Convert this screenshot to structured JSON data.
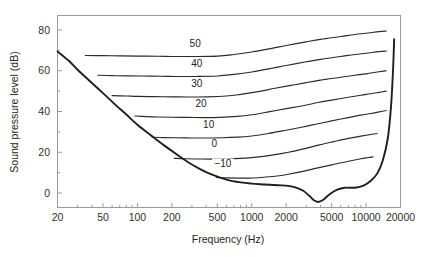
{
  "chart_data": {
    "type": "line",
    "title": "",
    "xlabel": "Frequency (Hz)",
    "ylabel": "Sound pressure level (dB)",
    "xscale": "log",
    "xlim": [
      20,
      20000
    ],
    "ylim": [
      -10,
      85
    ],
    "grid": false,
    "legend": "inline-labels",
    "xticks": [
      20,
      50,
      100,
      200,
      500,
      1000,
      2000,
      5000,
      10000,
      20000
    ],
    "xtick_labels": [
      "20",
      "50",
      "100",
      "200",
      "500",
      "1000",
      "2000",
      "5000",
      "10000",
      "20000"
    ],
    "yticks": [
      0,
      20,
      40,
      60,
      80
    ],
    "ytick_labels": [
      "0",
      "20",
      "40",
      "60",
      "80"
    ],
    "yticks_minor": [
      10,
      30,
      50,
      70
    ],
    "series": [
      {
        "name": "50",
        "label": "50",
        "label_freq": 320,
        "label_level": 71.5,
        "x": [
          35,
          50,
          70,
          100,
          150,
          200,
          300,
          500,
          700,
          1000,
          1500,
          2000,
          3000,
          4000,
          6000,
          8000,
          10000,
          13000,
          15000
        ],
        "values": [
          67.5,
          67.4,
          67.3,
          67.2,
          67.1,
          67.0,
          67.0,
          67.2,
          68.0,
          69.2,
          71.0,
          72.4,
          74.2,
          75.4,
          76.8,
          77.8,
          78.4,
          79.2,
          79.5
        ]
      },
      {
        "name": "40",
        "label": "40",
        "label_freq": 330,
        "label_level": 62.0,
        "x": [
          45,
          60,
          80,
          110,
          160,
          220,
          320,
          500,
          700,
          1000,
          1500,
          2000,
          3000,
          4000,
          6000,
          8000,
          10000,
          13000,
          15000
        ],
        "values": [
          57.8,
          57.6,
          57.5,
          57.4,
          57.3,
          57.2,
          57.2,
          57.4,
          58.2,
          59.4,
          61.2,
          62.6,
          64.4,
          65.6,
          67.0,
          68.0,
          68.6,
          69.4,
          69.7
        ]
      },
      {
        "name": "30",
        "label": "30",
        "label_freq": 330,
        "label_level": 52.0,
        "x": [
          60,
          80,
          100,
          140,
          200,
          280,
          400,
          600,
          800,
          1100,
          1600,
          2200,
          3000,
          4000,
          6000,
          8000,
          10000,
          13000,
          15000
        ],
        "values": [
          47.8,
          47.6,
          47.4,
          47.3,
          47.2,
          47.1,
          47.2,
          47.6,
          48.4,
          49.6,
          51.4,
          52.8,
          54.2,
          55.4,
          56.8,
          57.8,
          58.5,
          59.5,
          60.0
        ]
      },
      {
        "name": "20",
        "label": "20",
        "label_freq": 360,
        "label_level": 42.0,
        "x": [
          95,
          120,
          150,
          200,
          280,
          380,
          520,
          750,
          1000,
          1400,
          2000,
          2800,
          3800,
          5000,
          7000,
          9000,
          11000,
          13000,
          15000
        ],
        "values": [
          37.8,
          37.5,
          37.3,
          37.2,
          37.1,
          37.0,
          37.1,
          37.6,
          38.4,
          39.8,
          41.4,
          42.8,
          44.4,
          45.6,
          47.0,
          48.0,
          48.7,
          49.4,
          50.0
        ]
      },
      {
        "name": "10",
        "label": "10",
        "label_freq": 420,
        "label_level": 32.0,
        "x": [
          135,
          170,
          220,
          300,
          400,
          550,
          750,
          1000,
          1400,
          2000,
          2800,
          3800,
          5000,
          7000,
          9000,
          11000,
          13000,
          15000
        ],
        "values": [
          27.4,
          27.2,
          27.1,
          27.0,
          27.0,
          27.1,
          27.4,
          28.0,
          29.2,
          30.8,
          32.4,
          34.0,
          35.4,
          37.0,
          38.2,
          39.0,
          39.8,
          40.5
        ]
      },
      {
        "name": "0",
        "label": "0",
        "label_freq": 470,
        "label_level": 22.5,
        "x": [
          210,
          260,
          330,
          440,
          600,
          800,
          1100,
          1500,
          2100,
          2900,
          3900,
          5200,
          7000,
          9000,
          11000,
          12500
        ],
        "values": [
          17.0,
          16.8,
          16.7,
          16.6,
          16.7,
          17.0,
          17.6,
          18.6,
          20.0,
          21.8,
          23.6,
          25.2,
          26.8,
          27.9,
          28.7,
          29.2
        ]
      },
      {
        "name": "-10",
        "label": "−10",
        "label_freq": 560,
        "label_level": 13.0,
        "x": [
          490,
          600,
          750,
          950,
          1200,
          1600,
          2100,
          2800,
          3700,
          5000,
          7000,
          9000,
          10500,
          11500
        ],
        "values": [
          7.6,
          7.4,
          7.3,
          7.3,
          7.6,
          8.2,
          9.2,
          10.6,
          12.2,
          13.8,
          15.6,
          16.8,
          17.4,
          17.8
        ]
      }
    ],
    "threshold_curve": {
      "name": "threshold-of-hearing",
      "x": [
        20,
        25,
        30,
        40,
        50,
        65,
        80,
        100,
        130,
        170,
        220,
        280,
        360,
        450,
        600,
        800,
        1000,
        1300,
        1700,
        2000,
        2400,
        2800,
        3200,
        3500,
        3800,
        4200,
        4800,
        5600,
        6500,
        8000,
        9500,
        11000,
        12500,
        14000,
        15500,
        16500,
        17200,
        17600
      ],
      "values": [
        69.5,
        65.0,
        60.5,
        54.0,
        49.0,
        43.0,
        38.5,
        33.5,
        28.5,
        23.5,
        19.0,
        15.0,
        11.5,
        9.0,
        6.6,
        5.2,
        4.6,
        4.2,
        3.8,
        3.6,
        2.8,
        1.2,
        -1.5,
        -3.6,
        -4.4,
        -3.4,
        -0.6,
        1.6,
        2.6,
        2.6,
        3.6,
        6.0,
        9.5,
        16.0,
        27.0,
        42.0,
        60.0,
        75.5
      ]
    }
  },
  "figure": {
    "background": "#ffffff",
    "axis_color": "#9a9a9a",
    "curve_color": "#2b2b2b",
    "threshold_color": "#1f1f1f",
    "text_color": "#262626"
  }
}
